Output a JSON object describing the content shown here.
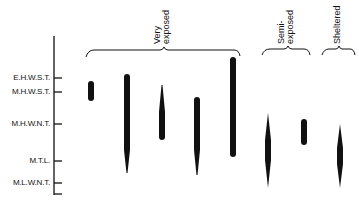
{
  "diagram": {
    "type": "vertical zonation range bars",
    "axis": {
      "levels": [
        {
          "label": "E.H.W.S.T.",
          "y": 78
        },
        {
          "label": "M.H.W.S.T.",
          "y": 92
        },
        {
          "label": "M.H.W.N.T.",
          "y": 124
        },
        {
          "label": "M.T.L.",
          "y": 161
        },
        {
          "label": "M.L.W.N.T.",
          "y": 183
        }
      ]
    },
    "groups": [
      {
        "label_line1": "Very",
        "label_line2": "exposed"
      },
      {
        "label_line1": "Semi-",
        "label_line2": "exposed"
      },
      {
        "label_line1": "Sheltered",
        "label_line2": ""
      }
    ],
    "bars": [
      {
        "group": "Very exposed",
        "top": "E.H.W.S.T.",
        "bottom": "below M.H.W.S.T.",
        "shape": "rounded"
      },
      {
        "group": "Very exposed",
        "top": "above E.H.W.S.T.",
        "bottom": "between M.T.L. and M.L.W.N.T.",
        "shape": "taper-bottom"
      },
      {
        "group": "Very exposed",
        "top": "M.H.W.S.T.",
        "bottom": "below M.H.W.N.T.",
        "shape": "taper-top"
      },
      {
        "group": "Very exposed",
        "top": "between M.H.W.S.T. and M.H.W.N.T.",
        "bottom": "between M.T.L. and M.L.W.N.T.",
        "shape": "taper-bottom"
      },
      {
        "group": "Very exposed",
        "top": "well above E.H.W.S.T.",
        "bottom": "just above M.T.L.",
        "shape": "rounded"
      },
      {
        "group": "Semi-exposed",
        "top": "below M.H.W.N.T.",
        "bottom": "near M.L.W.N.T.",
        "shape": "spindle"
      },
      {
        "group": "Semi-exposed",
        "top": "M.H.W.N.T.",
        "bottom": "between M.H.W.N.T. and M.T.L.",
        "shape": "rounded"
      },
      {
        "group": "Sheltered",
        "top": "M.H.W.N.T.",
        "bottom": "near M.L.W.N.T.",
        "shape": "spindle"
      }
    ],
    "colors": {
      "ink": "#111111",
      "background": "#ffffff"
    }
  }
}
